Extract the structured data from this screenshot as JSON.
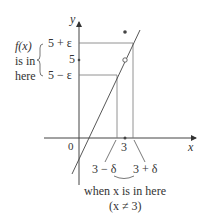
{
  "diagram": {
    "axis_labels": {
      "x": "x",
      "y": "y",
      "origin": "0"
    },
    "y_ticks": {
      "upper": "5 + ε",
      "center": "5",
      "lower": "5 − ε"
    },
    "left_note": [
      "f(x)",
      "is in",
      "here"
    ],
    "x_ticks": {
      "center": "3",
      "left": "3 − δ",
      "right": "3 + δ"
    },
    "bottom_note": {
      "line1": "when x is in here",
      "line2": "(x ≠ 3)"
    }
  }
}
